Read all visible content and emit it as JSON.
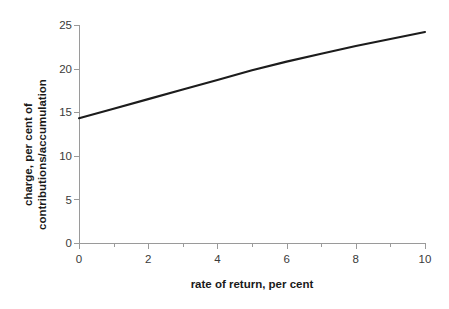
{
  "chart_data": {
    "type": "line",
    "title": "",
    "xlabel": "rate of return, per cent",
    "ylabel_line1": "charge, per cent of",
    "ylabel_line2": "contributions/accumulation",
    "ylabel": "charge, per cent of contributions/accumulation",
    "x": [
      0,
      1,
      2,
      3,
      4,
      5,
      6,
      7,
      8,
      9,
      10
    ],
    "values": [
      14.3,
      15.4,
      16.5,
      17.6,
      18.7,
      19.8,
      20.8,
      21.7,
      22.6,
      23.4,
      24.2
    ],
    "series": [
      {
        "name": "charge",
        "values": [
          14.3,
          15.4,
          16.5,
          17.6,
          18.7,
          19.8,
          20.8,
          21.7,
          22.6,
          23.4,
          24.2
        ]
      }
    ],
    "xlim": [
      0,
      10
    ],
    "ylim": [
      0,
      25
    ],
    "xticks": [
      0,
      2,
      4,
      6,
      8,
      10
    ],
    "xtick_labels": [
      "0",
      "2",
      "4",
      "6",
      "8",
      "10"
    ],
    "x_minor_ticks": [
      1,
      3,
      5,
      7,
      9
    ],
    "yticks": [
      0,
      5,
      10,
      15,
      20,
      25
    ],
    "ytick_labels": [
      "0",
      "5",
      "10",
      "15",
      "20",
      "25"
    ],
    "grid": false,
    "legend": false,
    "legend_position": "none",
    "line_color": "#1c1c1c",
    "axis_color": "#9a9a9a",
    "background_color": "#ffffff"
  }
}
